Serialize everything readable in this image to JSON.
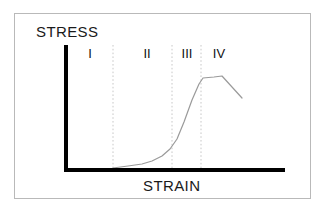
{
  "figure": {
    "name": "stress-strain-curve-diagram",
    "background_color": "#ffffff",
    "frame_border_color": "#b9b9b9",
    "axis_color": "#000000",
    "curve_color": "#9a9a9a",
    "divider_color": "#c8c8c8"
  },
  "labels": {
    "y_axis_title": "STRESS",
    "x_axis_title": "STRAIN"
  },
  "regions": [
    {
      "id": "I",
      "label": "I",
      "center_x": 90
    },
    {
      "id": "II",
      "label": "II",
      "center_x": 147
    },
    {
      "id": "III",
      "label": "III",
      "center_x": 187
    },
    {
      "id": "IV",
      "label": "IV",
      "center_x": 219
    }
  ],
  "chart_data": {
    "type": "line",
    "title": "",
    "xlabel": "STRAIN",
    "ylabel": "STRESS",
    "grid": false,
    "legend": "none",
    "axis_pixel_geometry": {
      "y_axis_x": 65,
      "y_axis_top_y": 45,
      "x_axis_y": 170,
      "x_axis_right_x": 285
    },
    "region_dividers_x": [
      113,
      172,
      201
    ],
    "curve_points": [
      [
        113,
        168
      ],
      [
        128,
        166
      ],
      [
        142,
        164
      ],
      [
        152,
        161
      ],
      [
        162,
        156
      ],
      [
        170,
        149
      ],
      [
        177,
        139
      ],
      [
        184,
        122
      ],
      [
        192,
        100
      ],
      [
        199,
        84
      ],
      [
        203,
        78
      ],
      [
        214,
        77
      ],
      [
        222,
        76
      ],
      [
        242,
        98
      ]
    ]
  }
}
